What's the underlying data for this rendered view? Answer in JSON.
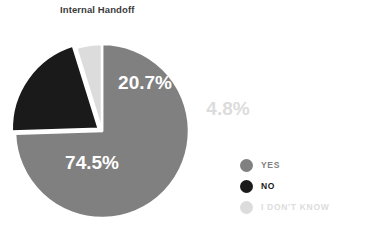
{
  "chart_data": {
    "type": "pie",
    "title": "Internal Handoff",
    "xlabel": "",
    "ylabel": "",
    "categories": [
      "YES",
      "NO",
      "I DON'T KNOW"
    ],
    "values": [
      74.5,
      20.7,
      4.8
    ],
    "unit": "%",
    "data_labels": [
      "74.5%",
      "20.7%",
      "4.8%"
    ],
    "colors": [
      "#808080",
      "#1a1a1a",
      "#dcdcdc"
    ],
    "legend": {
      "position": "right",
      "entries": [
        {
          "label": "YES",
          "color": "#808080",
          "text_color": "#808080"
        },
        {
          "label": "NO",
          "color": "#1a1a1a",
          "text_color": "#1a1a1a"
        },
        {
          "label": "I DON'T KNOW",
          "color": "#dcdcdc",
          "text_color": "#dcdcdc"
        }
      ]
    },
    "geometry": {
      "center_x": 102,
      "center_y": 131,
      "radius": 87,
      "start_angle_deg": -90,
      "exploded_slice_index": 1,
      "explode_offset": 4,
      "gap_stroke": "#ffffff",
      "gap_width": 2.5
    },
    "label_positions": [
      {
        "text": "74.5%",
        "x": 92,
        "y": 169,
        "color": "#ffffff",
        "size": 19,
        "anchor": "middle"
      },
      {
        "text": "20.7%",
        "x": 145,
        "y": 89,
        "color": "#ffffff",
        "size": 19,
        "anchor": "middle"
      },
      {
        "text": "4.8%",
        "x": 228,
        "y": 115,
        "color": "#dcdcdc",
        "size": 19,
        "anchor": "middle"
      }
    ],
    "grid": false,
    "background": "#ffffff"
  }
}
